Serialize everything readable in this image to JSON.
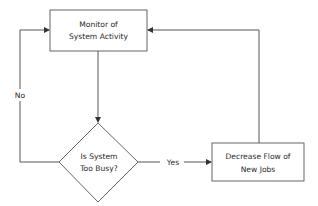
{
  "diagram": {
    "type": "flowchart",
    "nodes": [
      {
        "id": "monitor",
        "shape": "rectangle",
        "lines": [
          "Monitor of",
          "System Activity"
        ]
      },
      {
        "id": "decision",
        "shape": "diamond",
        "lines": [
          "Is System",
          "Too Busy?"
        ]
      },
      {
        "id": "decrease",
        "shape": "rectangle",
        "lines": [
          "Decrease Flow of",
          "New Jobs"
        ]
      }
    ],
    "edges": [
      {
        "from": "monitor",
        "to": "decision",
        "label": ""
      },
      {
        "from": "decision",
        "to": "decrease",
        "label": "Yes"
      },
      {
        "from": "decision",
        "to": "monitor",
        "label": "No"
      },
      {
        "from": "decrease",
        "to": "monitor",
        "label": ""
      }
    ]
  }
}
